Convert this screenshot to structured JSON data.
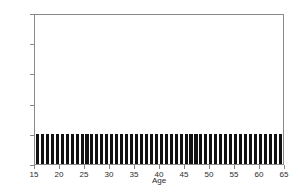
{
  "chart_data": {
    "type": "bar",
    "title": "",
    "subtitle": "",
    "xlabel": "Age",
    "ylabel": "",
    "xlim": [
      15,
      65
    ],
    "ylim": [
      0,
      10
    ],
    "grid": false,
    "legend": null,
    "annotations": [],
    "y_tick_labels": [
      "0%",
      "2%",
      "4%",
      "6%",
      "8%",
      "10%"
    ],
    "y_tick_values": [
      0,
      2,
      4,
      6,
      8,
      10
    ],
    "x_tick_labels": [
      "15",
      "20",
      "25",
      "30",
      "35",
      "40",
      "45",
      "50",
      "55",
      "60",
      "65"
    ],
    "x_tick_values": [
      15,
      20,
      25,
      30,
      35,
      40,
      45,
      50,
      55,
      60,
      65
    ],
    "bar_color": "#111111",
    "axis_color": "#8a8a8a",
    "background_color": "#ffffff",
    "categories": [
      15,
      16,
      17,
      18,
      19,
      20,
      21,
      22,
      23,
      24,
      25,
      26,
      27,
      28,
      29,
      30,
      31,
      32,
      33,
      34,
      35,
      36,
      37,
      38,
      39,
      40,
      41,
      42,
      43,
      44,
      45,
      46,
      47,
      48,
      49,
      50,
      51,
      52,
      53,
      54,
      55,
      56,
      57,
      58,
      59,
      60,
      61,
      62,
      63,
      64
    ],
    "values": [
      2,
      2,
      2,
      2,
      2,
      2,
      2,
      2,
      2,
      2,
      2,
      2,
      2,
      2,
      2,
      2,
      2,
      2,
      2,
      2,
      2,
      2,
      2,
      2,
      2,
      2,
      2,
      2,
      2,
      2,
      2,
      2,
      2,
      2,
      2,
      2,
      2,
      2,
      2,
      2,
      2,
      2,
      2,
      2,
      2,
      2,
      2,
      2,
      2,
      2
    ]
  }
}
